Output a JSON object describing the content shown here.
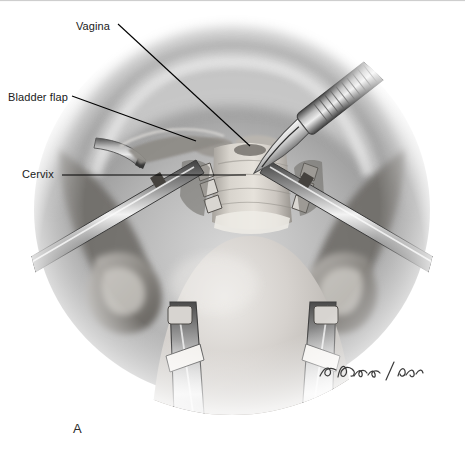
{
  "figure": {
    "panel_label": "A",
    "width": 465,
    "height": 470,
    "background_color": "#ffffff",
    "signature_name": "artist-signature"
  },
  "labels": [
    {
      "id": "vagina",
      "text": "Vagina",
      "leader": "diagonal-down-right"
    },
    {
      "id": "bladder_flap",
      "text": "Bladder flap",
      "leader": "diagonal-down-right"
    },
    {
      "id": "cervix",
      "text": "Cervix",
      "leader": "horizontal-right"
    }
  ],
  "anatomy": [
    {
      "name": "abdominal-wall-arch",
      "tone": "#b9b9b9"
    },
    {
      "name": "uterine-body-dome",
      "tone": "#c9c6c2"
    },
    {
      "name": "cervix-body",
      "tone": "#cfccc6"
    },
    {
      "name": "vaginal-cuff",
      "tone": "#a9a6a2"
    },
    {
      "name": "bladder-flap-tissue",
      "tone": "#9a9894"
    },
    {
      "name": "left-adnexa",
      "tone": "#8d8b88"
    },
    {
      "name": "right-adnexa",
      "tone": "#8d8b88"
    }
  ],
  "instruments": [
    {
      "name": "scalpel",
      "position": "upper-right"
    },
    {
      "name": "left-clamp-shaft",
      "position": "mid-left"
    },
    {
      "name": "right-clamp-shaft",
      "position": "mid-right"
    },
    {
      "name": "left-cervical-clamp",
      "position": "center-left"
    },
    {
      "name": "right-cervical-clamp",
      "position": "center-right"
    },
    {
      "name": "left-lower-retractor",
      "position": "bottom-left"
    },
    {
      "name": "right-lower-retractor",
      "position": "bottom-right"
    }
  ],
  "colors": {
    "ink": "#1a1a1a",
    "leader_line": "#000000",
    "paper": "#ffffff",
    "mid_gray": "#9b9b9b",
    "dark_gray": "#4a4a4a",
    "light_gray": "#d8d8d8"
  }
}
